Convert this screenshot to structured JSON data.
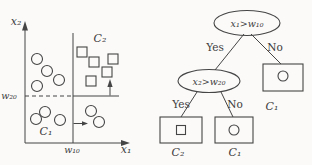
{
  "figure": {
    "scatter_plot": {
      "x_axis_label": "x₁",
      "y_axis_label": "x₂",
      "threshold_x_label": "w₁₀",
      "threshold_y_label": "w₂₀",
      "region_labels": {
        "upper_right": "C₂",
        "lower_left": "C₁"
      },
      "points": {
        "circles": [
          [
            37,
            59
          ],
          [
            47,
            71
          ],
          [
            37,
            86
          ],
          [
            59,
            80
          ],
          [
            45,
            112
          ],
          [
            36,
            119
          ],
          [
            60,
            120
          ],
          [
            91,
            111
          ],
          [
            99,
            122
          ]
        ],
        "squares": [
          [
            82,
            52
          ],
          [
            94,
            62
          ],
          [
            113,
            59
          ],
          [
            107,
            72
          ],
          [
            91,
            81
          ]
        ]
      },
      "thresholds": {
        "w10_x": 73,
        "w20_y": 96
      }
    },
    "decision_tree": {
      "root": {
        "label": "x₁>w₁₀"
      },
      "node2": {
        "label": "x₂>w₂₀"
      },
      "edge_labels": {
        "yes": "Yes",
        "no": "No"
      },
      "leaves": [
        {
          "symbol": "square",
          "class_label": "C₂"
        },
        {
          "symbol": "circle",
          "class_label": "C₁"
        },
        {
          "symbol": "circle",
          "class_label": "C₁"
        }
      ]
    },
    "colors": {
      "ink": "#454545",
      "background": "#fbfaf9"
    }
  }
}
